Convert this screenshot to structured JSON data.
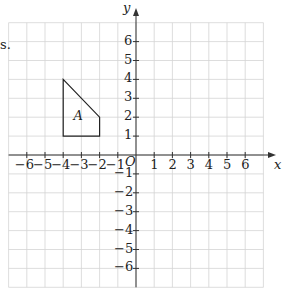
{
  "fragment_text": "s.",
  "axes": {
    "x_label": "x",
    "y_label": "y",
    "origin_label": "O",
    "x_ticks": [
      "−6",
      "−5",
      "−4",
      "−3",
      "−2",
      "−1",
      "1",
      "2",
      "3",
      "4",
      "5",
      "6"
    ],
    "y_ticks": [
      "6",
      "5",
      "4",
      "3",
      "2",
      "1",
      "−1",
      "−2",
      "−3",
      "−4",
      "−5",
      "−6"
    ]
  },
  "shape": {
    "label": "A",
    "vertices": [
      [
        -4,
        4
      ],
      [
        -2,
        2
      ],
      [
        -2,
        1
      ],
      [
        -4,
        1
      ]
    ]
  },
  "grid": {
    "xmin": -7,
    "xmax": 7,
    "ymin": -7,
    "ymax": 7
  }
}
